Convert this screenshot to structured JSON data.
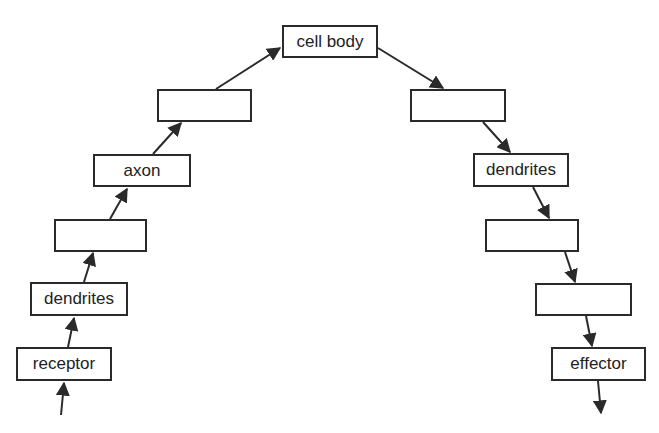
{
  "diagram": {
    "type": "neural-pathway-flowchart",
    "colors": {
      "line": "#2a2a2a",
      "text": "#222222",
      "background": "#ffffff"
    },
    "nodes": [
      {
        "id": "receptor",
        "label": "receptor",
        "x": 16,
        "y": 347,
        "w": 96,
        "h": 34
      },
      {
        "id": "dendrites-in",
        "label": "dendrites",
        "x": 30,
        "y": 282,
        "w": 98,
        "h": 34
      },
      {
        "id": "blank-left-1",
        "label": "",
        "x": 54,
        "y": 219,
        "w": 93,
        "h": 33
      },
      {
        "id": "axon",
        "label": "axon",
        "x": 93,
        "y": 154,
        "w": 98,
        "h": 33
      },
      {
        "id": "blank-left-2",
        "label": "",
        "x": 157,
        "y": 89,
        "w": 95,
        "h": 33
      },
      {
        "id": "cell-body",
        "label": "cell body",
        "x": 282,
        "y": 25,
        "w": 96,
        "h": 33
      },
      {
        "id": "blank-right-1",
        "label": "",
        "x": 410,
        "y": 89,
        "w": 96,
        "h": 33
      },
      {
        "id": "dendrites-out",
        "label": "dendrites",
        "x": 473,
        "y": 153,
        "w": 96,
        "h": 34
      },
      {
        "id": "blank-right-2",
        "label": "",
        "x": 485,
        "y": 219,
        "w": 94,
        "h": 33
      },
      {
        "id": "blank-right-3",
        "label": "",
        "x": 535,
        "y": 283,
        "w": 97,
        "h": 33
      },
      {
        "id": "effector",
        "label": "effector",
        "x": 551,
        "y": 347,
        "w": 95,
        "h": 34
      }
    ],
    "edges": [
      {
        "from": "input",
        "to": "receptor",
        "x1": 61,
        "y1": 415,
        "x2": 64,
        "y2": 383
      },
      {
        "from": "receptor",
        "to": "dendrites-in",
        "x1": 68,
        "y1": 347,
        "x2": 74,
        "y2": 318
      },
      {
        "from": "dendrites-in",
        "to": "blank-left-1",
        "x1": 84,
        "y1": 282,
        "x2": 93,
        "y2": 253
      },
      {
        "from": "blank-left-1",
        "to": "axon",
        "x1": 110,
        "y1": 219,
        "x2": 127,
        "y2": 189
      },
      {
        "from": "axon",
        "to": "blank-left-2",
        "x1": 153,
        "y1": 154,
        "x2": 181,
        "y2": 123
      },
      {
        "from": "blank-left-2",
        "to": "cell-body",
        "x1": 216,
        "y1": 89,
        "x2": 280,
        "y2": 48
      },
      {
        "from": "cell-body",
        "to": "blank-right-1",
        "x1": 378,
        "y1": 48,
        "x2": 443,
        "y2": 88
      },
      {
        "from": "blank-right-1",
        "to": "dendrites-out",
        "x1": 483,
        "y1": 122,
        "x2": 510,
        "y2": 152
      },
      {
        "from": "dendrites-out",
        "to": "blank-right-2",
        "x1": 533,
        "y1": 187,
        "x2": 549,
        "y2": 218
      },
      {
        "from": "blank-right-2",
        "to": "blank-right-3",
        "x1": 565,
        "y1": 252,
        "x2": 575,
        "y2": 282
      },
      {
        "from": "blank-right-3",
        "to": "effector",
        "x1": 586,
        "y1": 316,
        "x2": 592,
        "y2": 346
      },
      {
        "from": "effector",
        "to": "output",
        "x1": 598,
        "y1": 381,
        "x2": 601,
        "y2": 413
      }
    ]
  }
}
